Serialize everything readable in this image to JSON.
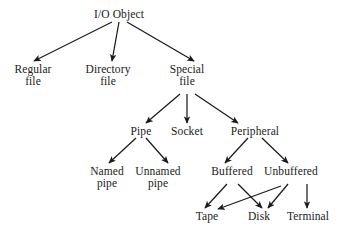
{
  "diagram": {
    "background_color": "#ffffff",
    "stroke_color": "#1a1a1a",
    "nodes": {
      "io_object": {
        "label": "I/O Object",
        "line2": ""
      },
      "regular_file": {
        "label": "Regular",
        "line2": "file"
      },
      "directory_file": {
        "label": "Directory",
        "line2": "file"
      },
      "special_file": {
        "label": "Special",
        "line2": "file"
      },
      "pipe": {
        "label": "Pipe",
        "line2": ""
      },
      "socket": {
        "label": "Socket",
        "line2": ""
      },
      "peripheral": {
        "label": "Peripheral",
        "line2": ""
      },
      "named_pipe": {
        "label": "Named",
        "line2": "pipe"
      },
      "unnamed_pipe": {
        "label": "Unnamed",
        "line2": "pipe"
      },
      "buffered": {
        "label": "Buffered",
        "line2": ""
      },
      "unbuffered": {
        "label": "Unbuffered",
        "line2": ""
      },
      "tape": {
        "label": "Tape",
        "line2": ""
      },
      "disk": {
        "label": "Disk",
        "line2": ""
      },
      "terminal": {
        "label": "Terminal",
        "line2": ""
      }
    },
    "edges": [
      {
        "from": "io_object",
        "to": "regular_file"
      },
      {
        "from": "io_object",
        "to": "directory_file"
      },
      {
        "from": "io_object",
        "to": "special_file"
      },
      {
        "from": "special_file",
        "to": "pipe"
      },
      {
        "from": "special_file",
        "to": "socket"
      },
      {
        "from": "special_file",
        "to": "peripheral"
      },
      {
        "from": "pipe",
        "to": "named_pipe"
      },
      {
        "from": "pipe",
        "to": "unnamed_pipe"
      },
      {
        "from": "peripheral",
        "to": "buffered"
      },
      {
        "from": "peripheral",
        "to": "unbuffered"
      },
      {
        "from": "buffered",
        "to": "tape"
      },
      {
        "from": "buffered",
        "to": "disk"
      },
      {
        "from": "unbuffered",
        "to": "tape"
      },
      {
        "from": "unbuffered",
        "to": "disk"
      },
      {
        "from": "unbuffered",
        "to": "terminal"
      }
    ]
  }
}
